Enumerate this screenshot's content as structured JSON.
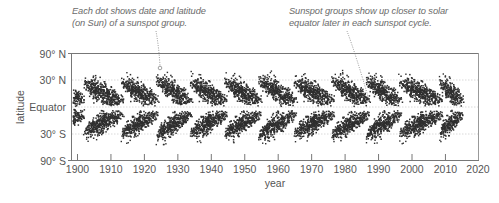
{
  "chart_data": {
    "type": "scatter",
    "title": "",
    "subtitle": "Sunspot butterfly diagram",
    "xlabel": "year",
    "ylabel": "latitude",
    "xlim": [
      1898,
      2020
    ],
    "ylim": [
      -90,
      90
    ],
    "x_ticks": [
      1900,
      1910,
      1920,
      1930,
      1940,
      1950,
      1960,
      1970,
      1980,
      1990,
      2000,
      2010,
      2020
    ],
    "x_tick_labels": [
      "1900",
      "1910",
      "1920",
      "1930",
      "1940",
      "1950",
      "1960",
      "1970",
      "1980",
      "1990",
      "2000",
      "2010",
      "2020"
    ],
    "y_ticks": [
      90,
      30,
      0,
      -30,
      -90
    ],
    "y_tick_labels": [
      "90° N",
      "30° N",
      "Equator",
      "30° S",
      "90° S"
    ],
    "grid": {
      "horizontal_dotted": [
        30,
        0,
        -30
      ]
    },
    "legend": null,
    "series": [
      {
        "name": "sunspot groups (date vs. latitude)",
        "marker": "dot",
        "color": "#2b2b2b"
      }
    ],
    "cycles": [
      {
        "start": 1890.0,
        "end": 1902.5,
        "peak_lat": 32
      },
      {
        "start": 1901.5,
        "end": 1914.0,
        "peak_lat": 35
      },
      {
        "start": 1912.8,
        "end": 1924.2,
        "peak_lat": 38
      },
      {
        "start": 1923.2,
        "end": 1934.3,
        "peak_lat": 40
      },
      {
        "start": 1933.3,
        "end": 1944.8,
        "peak_lat": 38
      },
      {
        "start": 1943.6,
        "end": 1955.0,
        "peak_lat": 38
      },
      {
        "start": 1953.8,
        "end": 1965.6,
        "peak_lat": 40
      },
      {
        "start": 1964.3,
        "end": 1976.9,
        "peak_lat": 38
      },
      {
        "start": 1975.6,
        "end": 1987.4,
        "peak_lat": 40
      },
      {
        "start": 1986.0,
        "end": 1997.0,
        "peak_lat": 39
      },
      {
        "start": 1995.8,
        "end": 2009.3,
        "peak_lat": 38
      },
      {
        "start": 2008.0,
        "end": 2015.3,
        "peak_lat": 36
      }
    ],
    "annotations": [
      {
        "text": "Each dot shows date and latitude (on Sun) of a sunspot group.",
        "points_to": {
          "x": 1924.5,
          "y": 40
        }
      },
      {
        "text": "Sunspot groups show up closer to solar equator later in each sunspot cycle.",
        "points_to": {
          "x": 1987.5,
          "y": 5
        }
      }
    ]
  },
  "annotations": {
    "left": {
      "line1": "Each dot shows date and latitude",
      "line2": "(on Sun) of a sunspot group."
    },
    "right": {
      "line1": "Sunspot groups show up closer to solar",
      "line2": "equator later in each sunspot cycle."
    }
  },
  "axes": {
    "y_title": "latitude",
    "x_title": "year",
    "y_labels": {
      "n90": "90° N",
      "n30": "30° N",
      "eq": "Equator",
      "s30": "30° S",
      "s90": "90° S"
    },
    "x_labels": [
      "1900",
      "1910",
      "1920",
      "1930",
      "1940",
      "1950",
      "1960",
      "1970",
      "1980",
      "1990",
      "2000",
      "2010",
      "2020"
    ]
  },
  "colors": {
    "dot": "#2f2f2f",
    "axis": "#666666",
    "grid": "#c8c8c8",
    "text": "#555555",
    "annotation": "#6b6b6b"
  }
}
